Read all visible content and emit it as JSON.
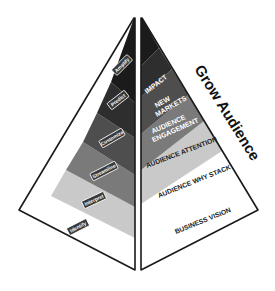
{
  "diagram": {
    "title": "Grow Audience",
    "left_face": {
      "layers": [
        {
          "label": "Amplify",
          "color": "#1b1b1b"
        },
        {
          "label": "Predict",
          "color": "#2e2e2e"
        },
        {
          "label": "Customize",
          "color": "#4e4e4e"
        },
        {
          "label": "Streamline",
          "color": "#7a7a7a"
        },
        {
          "label": "Interpret",
          "color": "#c9c9c9"
        },
        {
          "label": "Identify",
          "color": "#ffffff"
        }
      ]
    },
    "right_face": {
      "layers": [
        {
          "label": "IMPACT",
          "color": "#1b1b1b"
        },
        {
          "label_line1": "NEW",
          "label_line2": "MARKETS",
          "color": "#2e2e2e"
        },
        {
          "label_line1": "AUDIENCE",
          "label_line2": "ENGAGEMENT",
          "color": "#4e4e4e"
        },
        {
          "label": "AUDIENCE ATTENTION",
          "color": "#7a7a7a"
        },
        {
          "label": "AUDIENCE WHY STACK",
          "color": "#c9c9c9"
        },
        {
          "label": "BUSINESS VISION",
          "color": "#ffffff"
        }
      ]
    },
    "colors": {
      "outline": "#1a1a1a",
      "tag_fill": "#3a3a3a",
      "tag_border": "#ffffff"
    }
  }
}
